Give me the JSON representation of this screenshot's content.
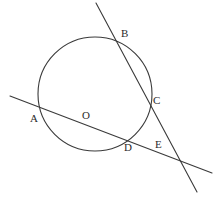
{
  "figure": {
    "type": "geometry-diagram",
    "width": 224,
    "height": 199,
    "background_color": "#ffffff",
    "stroke_color": "#3a3a3a",
    "label_color": "#2b2b2b",
    "stroke_width": 1.1
  },
  "circle": {
    "name": "circle-O",
    "center_label": "O",
    "center_x": 95,
    "center_y": 94,
    "radius": 57
  },
  "lines": [
    {
      "name": "secant-ADE",
      "through_points": [
        "A",
        "D",
        "E"
      ],
      "x1": 10,
      "y1": 96,
      "x2": 212,
      "y2": 173
    },
    {
      "name": "secant-BCE",
      "through_points": [
        "B",
        "C",
        "E"
      ],
      "x1": 96,
      "y1": 3,
      "x2": 197,
      "y2": 192
    }
  ],
  "points": [
    {
      "id": "A",
      "label": "A",
      "x": 40,
      "y": 107,
      "label_x": 30,
      "label_y": 113,
      "kind": "circle-line-intersection"
    },
    {
      "id": "B",
      "label": "B",
      "x": 118,
      "y": 43,
      "label_x": 121,
      "label_y": 28,
      "kind": "circle-line-intersection"
    },
    {
      "id": "C",
      "label": "C",
      "x": 149,
      "y": 105,
      "label_x": 153,
      "label_y": 95,
      "kind": "circle-line-intersection"
    },
    {
      "id": "D",
      "label": "D",
      "x": 128,
      "y": 141,
      "label_x": 124,
      "label_y": 142,
      "kind": "circle-line-intersection"
    },
    {
      "id": "E",
      "label": "E",
      "x": 180,
      "y": 161,
      "label_x": 155,
      "label_y": 139,
      "kind": "external-line-intersection"
    },
    {
      "id": "O",
      "label": "O",
      "x": 95,
      "y": 94,
      "label_x": 82,
      "label_y": 110,
      "kind": "circle-center"
    }
  ]
}
